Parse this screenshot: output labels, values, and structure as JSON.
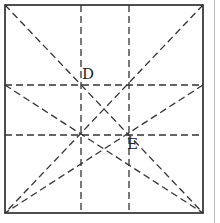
{
  "diagram": {
    "title": "",
    "labels": {
      "D": "D",
      "E": "E"
    },
    "caption": "",
    "colors": {
      "stroke": "#222222",
      "background": "#ffffff"
    },
    "square": {
      "x1": 5,
      "y1": 5,
      "x2": 203,
      "y2": 213
    },
    "vertical_dashed_x": [
      81,
      129
    ],
    "horizontal_dashed_y": [
      85,
      135
    ],
    "points": {
      "D": [
        81,
        85
      ],
      "E": [
        129,
        135
      ]
    },
    "dashed_diagonals": [
      [
        [
          5,
          5
        ],
        [
          203,
          213
        ]
      ],
      [
        [
          203,
          5
        ],
        [
          5,
          213
        ]
      ],
      [
        [
          5,
          85
        ],
        [
          203,
          213
        ]
      ],
      [
        [
          203,
          85
        ],
        [
          5,
          213
        ]
      ],
      [
        [
          5,
          213
        ],
        [
          203,
          85
        ]
      ],
      [
        [
          203,
          213
        ],
        [
          5,
          85
        ]
      ]
    ]
  }
}
